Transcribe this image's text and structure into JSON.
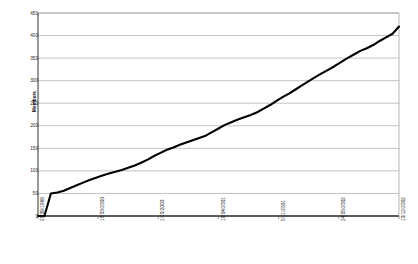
{
  "chart_data": {
    "type": "line",
    "title": "",
    "xlabel": "",
    "ylabel": "Members",
    "ylim": [
      0,
      450
    ],
    "ytick_labels": [
      "0",
      "50",
      "100",
      "150",
      "200",
      "250",
      "300",
      "350",
      "400",
      "450"
    ],
    "ytick_values": [
      0,
      50,
      100,
      150,
      200,
      250,
      300,
      350,
      400,
      450
    ],
    "xtick_labels": [
      "28/09/1999",
      "15/03/2000",
      "1/10/2000",
      "19/04/2001",
      "5/11/2001",
      "24/05/2002",
      "10/12/2002"
    ],
    "grid": true,
    "legend": "none",
    "series": [
      {
        "name": "Members",
        "x": [
          "28/09/1999",
          "20/12/1999",
          "21/12/1999",
          "10/01/2000",
          "01/02/2000",
          "20/02/2000",
          "10/03/2000",
          "01/04/2000",
          "20/04/2000",
          "10/05/2000",
          "01/06/2000",
          "20/06/2000",
          "10/07/2000",
          "01/08/2000",
          "20/08/2000",
          "10/09/2000",
          "01/10/2000",
          "20/10/2000",
          "10/11/2000",
          "01/12/2000",
          "20/12/2000",
          "10/01/2001",
          "01/02/2001",
          "20/02/2001",
          "10/03/2001",
          "01/04/2001",
          "19/04/2001",
          "10/05/2001",
          "01/06/2001",
          "20/06/2001",
          "10/07/2001",
          "01/08/2001",
          "20/08/2001",
          "10/09/2001",
          "01/10/2001",
          "20/10/2001",
          "05/11/2001",
          "25/11/2001",
          "15/12/2001",
          "05/01/2002",
          "25/01/2002",
          "15/02/2002",
          "05/03/2002",
          "25/03/2002",
          "15/04/2002",
          "05/05/2002",
          "24/05/2002",
          "15/06/2002",
          "05/07/2002",
          "25/07/2002",
          "15/08/2002",
          "05/09/2002",
          "25/09/2002",
          "15/10/2002",
          "05/11/2002",
          "25/11/2002",
          "10/12/2002"
        ],
        "values": [
          0,
          0,
          50,
          52,
          56,
          62,
          68,
          74,
          80,
          85,
          90,
          94,
          98,
          102,
          107,
          112,
          118,
          125,
          133,
          140,
          147,
          152,
          158,
          163,
          168,
          173,
          178,
          186,
          194,
          202,
          208,
          214,
          219,
          224,
          230,
          238,
          246,
          255,
          264,
          272,
          281,
          290,
          299,
          308,
          316,
          324,
          332,
          341,
          350,
          358,
          366,
          372,
          379,
          388,
          396,
          404,
          420
        ]
      }
    ]
  }
}
